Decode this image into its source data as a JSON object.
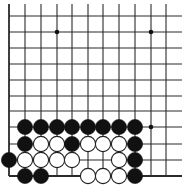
{
  "board": {
    "description": "Go problem diagram, lower-left corner of the board",
    "colors": {
      "background": "#ffffff",
      "line": "#2a2a2a",
      "black_stone": "#111111",
      "white_stone_fill": "#ffffff",
      "white_stone_stroke": "#222222",
      "star_point": "#111111"
    },
    "grid": {
      "col_x": [
        9,
        25,
        41,
        57,
        72,
        88,
        103,
        119,
        135,
        151,
        166,
        182
      ],
      "row_y": [
        16,
        32,
        48,
        64,
        80,
        96,
        111,
        127,
        144,
        160,
        176
      ],
      "left_edge_col": 0,
      "bottom_edge_row": 10,
      "top_open": true,
      "right_open": true,
      "line_top": 4,
      "line_right": 182
    },
    "stone_radius": 7.6,
    "star_points": [
      {
        "col": 3,
        "row": 1
      },
      {
        "col": 9,
        "row": 1
      },
      {
        "col": 9,
        "row": 7
      }
    ],
    "stones": [
      {
        "color": "black",
        "col": 1,
        "row": 7
      },
      {
        "color": "black",
        "col": 2,
        "row": 7
      },
      {
        "color": "black",
        "col": 3,
        "row": 7
      },
      {
        "color": "black",
        "col": 4,
        "row": 7
      },
      {
        "color": "black",
        "col": 5,
        "row": 7
      },
      {
        "color": "black",
        "col": 6,
        "row": 7
      },
      {
        "color": "black",
        "col": 7,
        "row": 7
      },
      {
        "color": "black",
        "col": 8,
        "row": 7
      },
      {
        "color": "black",
        "col": 1,
        "row": 8
      },
      {
        "color": "white",
        "col": 2,
        "row": 8
      },
      {
        "color": "white",
        "col": 3,
        "row": 8
      },
      {
        "color": "black",
        "col": 4,
        "row": 8
      },
      {
        "color": "white",
        "col": 5,
        "row": 8
      },
      {
        "color": "white",
        "col": 6,
        "row": 8
      },
      {
        "color": "white",
        "col": 7,
        "row": 8
      },
      {
        "color": "black",
        "col": 8,
        "row": 8
      },
      {
        "color": "black",
        "col": 0,
        "row": 9
      },
      {
        "color": "white",
        "col": 1,
        "row": 9
      },
      {
        "color": "white",
        "col": 2,
        "row": 9
      },
      {
        "color": "white",
        "col": 3,
        "row": 9
      },
      {
        "color": "white",
        "col": 4,
        "row": 9
      },
      {
        "color": "white",
        "col": 7,
        "row": 9
      },
      {
        "color": "black",
        "col": 8,
        "row": 9
      },
      {
        "color": "black",
        "col": 1,
        "row": 10
      },
      {
        "color": "black",
        "col": 2,
        "row": 10
      },
      {
        "color": "white",
        "col": 5,
        "row": 10
      },
      {
        "color": "white",
        "col": 6,
        "row": 10
      },
      {
        "color": "white",
        "col": 7,
        "row": 10
      },
      {
        "color": "black",
        "col": 8,
        "row": 10
      }
    ]
  }
}
